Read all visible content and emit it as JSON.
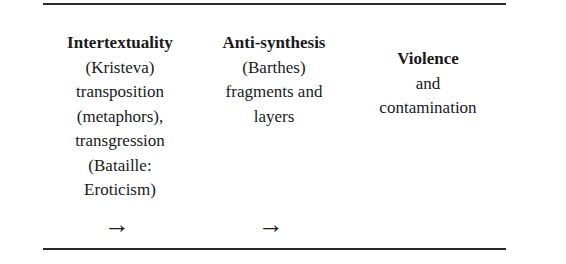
{
  "columns": [
    {
      "title": "Intertextuality",
      "lines": [
        "(Kristeva)",
        "transposition",
        "(metaphors),",
        "transgression",
        "(Bataille:",
        "Eroticism)"
      ]
    },
    {
      "title": "Anti-synthesis",
      "lines": [
        "(Barthes)",
        "fragments and",
        "layers"
      ]
    },
    {
      "title": "Violence",
      "lines": [
        "and",
        "contamination"
      ]
    }
  ],
  "arrows": [
    {
      "icon": "right-arrow-icon",
      "glyph": "→"
    },
    {
      "icon": "right-arrow-icon",
      "glyph": "→"
    }
  ]
}
